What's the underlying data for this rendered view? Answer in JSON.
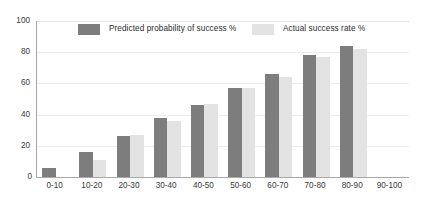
{
  "chart_data": {
    "type": "bar",
    "title": "",
    "xlabel": "",
    "ylabel": "",
    "ylim": [
      0,
      100
    ],
    "yticks": [
      0,
      20,
      40,
      60,
      80,
      100
    ],
    "grid": true,
    "legend_position": "top",
    "categories": [
      "0-10",
      "10-20",
      "20-30",
      "30-40",
      "40-50",
      "50-60",
      "60-70",
      "70-80",
      "80-90",
      "90-100"
    ],
    "series": [
      {
        "name": "Predicted probability of success %",
        "color": "#7d7d7d",
        "values": [
          6,
          16,
          26,
          38,
          46,
          57,
          66,
          78,
          84,
          0
        ]
      },
      {
        "name": "Actual success rate %",
        "color": "#e3e3e3",
        "values": [
          0,
          11,
          27,
          36,
          47,
          57,
          64,
          77,
          82,
          0
        ]
      }
    ]
  },
  "axis": {
    "y_tick_labels": [
      "100",
      "80",
      "60",
      "40",
      "20",
      "0"
    ],
    "zero_label": "0"
  },
  "colors": {
    "predicted": "#7d7d7d",
    "actual": "#e3e3e3",
    "gridline": "#ececec",
    "axis": "#a8a8a8",
    "background": "#ffffff"
  }
}
